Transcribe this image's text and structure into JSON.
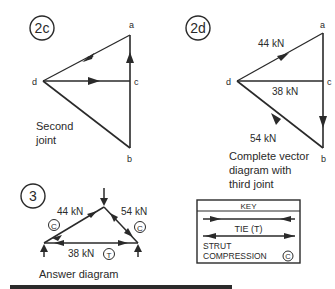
{
  "panel_2c": {
    "badge": "2c",
    "points": {
      "a": "a",
      "b": "b",
      "c": "c",
      "d": "d"
    },
    "caption_line1": "Second",
    "caption_line2": "joint"
  },
  "panel_2d": {
    "badge": "2d",
    "points": {
      "a": "a",
      "b": "b",
      "c": "c",
      "d": "d"
    },
    "force_da": "44 kN",
    "force_dc": "38 kN",
    "force_bd": "54 kN",
    "caption_line1": "Complete vector",
    "caption_line2": "diagram with",
    "caption_line3": "third joint"
  },
  "panel_3": {
    "badge": "3",
    "left_member": "44 kN",
    "right_member": "54 kN",
    "bottom_member": "38 kN",
    "left_type": "C",
    "right_type": "C",
    "bottom_type": "T",
    "caption": "Answer diagram"
  },
  "key": {
    "title": "KEY",
    "tie_label": "TIE (T)",
    "strut_line1": "STRUT",
    "strut_line2": "COMPRESSION",
    "strut_symbol": "C"
  },
  "colors": {
    "line": "#2a2a2a",
    "background": "#ffffff"
  }
}
